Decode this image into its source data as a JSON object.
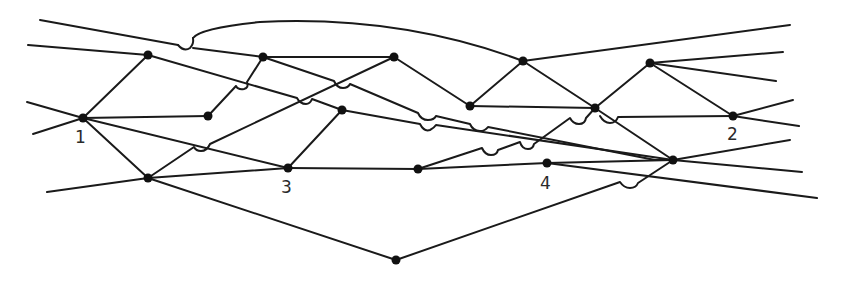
{
  "diagram": {
    "type": "network-graph",
    "colors": {
      "line": "#1a1a1a",
      "node": "#111111",
      "background": "#ffffff"
    },
    "labels": {
      "n1": "1",
      "n2": "2",
      "n3": "3",
      "n4": "4"
    },
    "nodes": [
      {
        "id": "n1",
        "label": "1",
        "x": 83,
        "y": 118
      },
      {
        "id": "A",
        "x": 148,
        "y": 55
      },
      {
        "id": "B",
        "x": 263,
        "y": 57
      },
      {
        "id": "C",
        "x": 208,
        "y": 116
      },
      {
        "id": "D",
        "x": 394,
        "y": 57
      },
      {
        "id": "E",
        "x": 342,
        "y": 110
      },
      {
        "id": "F",
        "x": 148,
        "y": 178
      },
      {
        "id": "n3",
        "label": "3",
        "x": 288,
        "y": 168
      },
      {
        "id": "G",
        "x": 470,
        "y": 106
      },
      {
        "id": "H",
        "x": 523,
        "y": 61
      },
      {
        "id": "I",
        "x": 418,
        "y": 169
      },
      {
        "id": "n4",
        "label": "4",
        "x": 547,
        "y": 163
      },
      {
        "id": "J",
        "x": 595,
        "y": 108
      },
      {
        "id": "K",
        "x": 650,
        "y": 63
      },
      {
        "id": "n2",
        "label": "2",
        "x": 733,
        "y": 116
      },
      {
        "id": "L",
        "x": 673,
        "y": 160
      },
      {
        "id": "M",
        "x": 396,
        "y": 260
      }
    ],
    "edges": [
      [
        "n1",
        "A"
      ],
      [
        "n1",
        "C"
      ],
      [
        "n1",
        "F"
      ],
      [
        "n1",
        "n3"
      ],
      [
        "A",
        "B"
      ],
      [
        "A",
        "E"
      ],
      [
        "A",
        "H"
      ],
      [
        "B",
        "C"
      ],
      [
        "B",
        "D"
      ],
      [
        "B",
        "G"
      ],
      [
        "D",
        "G"
      ],
      [
        "D",
        "F"
      ],
      [
        "E",
        "n3"
      ],
      [
        "E",
        "n4"
      ],
      [
        "F",
        "n3"
      ],
      [
        "F",
        "M"
      ],
      [
        "n3",
        "I"
      ],
      [
        "I",
        "n4"
      ],
      [
        "I",
        "J"
      ],
      [
        "G",
        "H"
      ],
      [
        "G",
        "J"
      ],
      [
        "H",
        "J"
      ],
      [
        "J",
        "K"
      ],
      [
        "J",
        "L"
      ],
      [
        "K",
        "n2"
      ],
      [
        "n2",
        "J"
      ],
      [
        "n4",
        "L"
      ],
      [
        "M",
        "L"
      ],
      [
        "E",
        "L"
      ]
    ],
    "stubs": 14,
    "hops": 12
  }
}
